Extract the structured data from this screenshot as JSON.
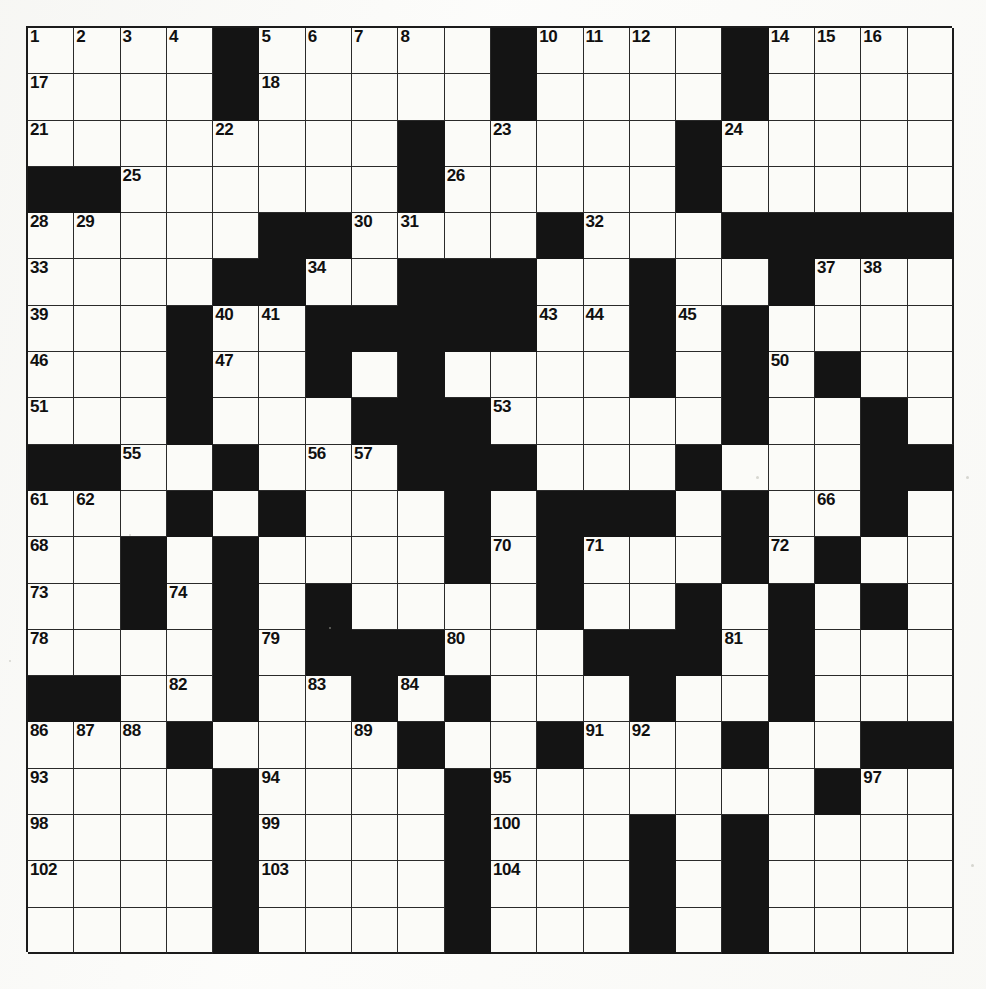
{
  "puzzle": {
    "type": "crossword",
    "title": "",
    "rows": 20,
    "cols": 20,
    "cell_size_px": 46.3,
    "colors": {
      "block": "#141414",
      "cell": "#fbfbf8",
      "grid_line": "#2a2a2a",
      "number_text": "#101010",
      "page_background": "#fdfdfc"
    },
    "max_clue_number": 105,
    "black_square_count": 116,
    "grid": [
      "....#.....#....#....",
      "....#.....#....#....",
      "........#.....#.....",
      "##......#.....#.....",
      ".....##....#...#####",
      "....##..###..#..#...",
      "...#..#####..#.#....",
      "...#..#.#....#.#.#..",
      "...#...###.....#..#.",
      "##..#...###...#...##",
      "...#.#...#.###.#..#.",
      "..#.#....#.#...#.#..",
      "..#.#.#....#..#.#.#.",
      "....#.###...###.#...",
      "##..#..#.#...#..#...",
      "...#....#..#...#..##",
      "....#....#.......#..",
      "....#....#...#.#....",
      "....#....#...#.#....",
      "....#....#...#.#...."
    ],
    "numbers": [
      {
        "n": 1,
        "row": 1,
        "col": 1
      },
      {
        "n": 2,
        "row": 1,
        "col": 2
      },
      {
        "n": 3,
        "row": 1,
        "col": 3
      },
      {
        "n": 4,
        "row": 1,
        "col": 4
      },
      {
        "n": 5,
        "row": 1,
        "col": 6
      },
      {
        "n": 6,
        "row": 1,
        "col": 7
      },
      {
        "n": 7,
        "row": 1,
        "col": 8
      },
      {
        "n": 8,
        "row": 1,
        "col": 9
      },
      {
        "n": 9,
        "row": 1,
        "col": 11
      },
      {
        "n": 10,
        "row": 1,
        "col": 12
      },
      {
        "n": 11,
        "row": 1,
        "col": 13
      },
      {
        "n": 12,
        "row": 1,
        "col": 14
      },
      {
        "n": 13,
        "row": 1,
        "col": 16
      },
      {
        "n": 14,
        "row": 1,
        "col": 17
      },
      {
        "n": 15,
        "row": 1,
        "col": 18
      },
      {
        "n": 16,
        "row": 1,
        "col": 19
      },
      {
        "n": 17,
        "row": 2,
        "col": 1
      },
      {
        "n": 18,
        "row": 2,
        "col": 6
      },
      {
        "n": 19,
        "row": 2,
        "col": 11
      },
      {
        "n": 20,
        "row": 2,
        "col": 16
      },
      {
        "n": 21,
        "row": 3,
        "col": 1
      },
      {
        "n": 22,
        "row": 3,
        "col": 5
      },
      {
        "n": 23,
        "row": 3,
        "col": 11
      },
      {
        "n": 24,
        "row": 3,
        "col": 16
      },
      {
        "n": 25,
        "row": 4,
        "col": 3
      },
      {
        "n": 26,
        "row": 4,
        "col": 10
      },
      {
        "n": 27,
        "row": 4,
        "col": 15
      },
      {
        "n": 28,
        "row": 5,
        "col": 1
      },
      {
        "n": 29,
        "row": 5,
        "col": 2
      },
      {
        "n": 30,
        "row": 5,
        "col": 8
      },
      {
        "n": 31,
        "row": 5,
        "col": 9
      },
      {
        "n": 32,
        "row": 5,
        "col": 13
      },
      {
        "n": 33,
        "row": 6,
        "col": 1
      },
      {
        "n": 34,
        "row": 6,
        "col": 7
      },
      {
        "n": 35,
        "row": 6,
        "col": 14
      },
      {
        "n": 36,
        "row": 6,
        "col": 17
      },
      {
        "n": 37,
        "row": 6,
        "col": 18
      },
      {
        "n": 38,
        "row": 6,
        "col": 19
      },
      {
        "n": 39,
        "row": 7,
        "col": 1
      },
      {
        "n": 40,
        "row": 7,
        "col": 5
      },
      {
        "n": 41,
        "row": 7,
        "col": 6
      },
      {
        "n": 42,
        "row": 7,
        "col": 11
      },
      {
        "n": 43,
        "row": 7,
        "col": 12
      },
      {
        "n": 44,
        "row": 7,
        "col": 13
      },
      {
        "n": 45,
        "row": 7,
        "col": 15
      },
      {
        "n": 46,
        "row": 8,
        "col": 1
      },
      {
        "n": 47,
        "row": 8,
        "col": 5
      },
      {
        "n": 48,
        "row": 8,
        "col": 9
      },
      {
        "n": 49,
        "row": 8,
        "col": 14
      },
      {
        "n": 50,
        "row": 8,
        "col": 17
      },
      {
        "n": 51,
        "row": 9,
        "col": 1
      },
      {
        "n": 52,
        "row": 9,
        "col": 4
      },
      {
        "n": 53,
        "row": 9,
        "col": 11
      },
      {
        "n": 54,
        "row": 9,
        "col": 16
      },
      {
        "n": 55,
        "row": 10,
        "col": 3
      },
      {
        "n": 56,
        "row": 10,
        "col": 7
      },
      {
        "n": 57,
        "row": 10,
        "col": 8
      },
      {
        "n": 58,
        "row": 10,
        "col": 9
      },
      {
        "n": 59,
        "row": 10,
        "col": 11
      },
      {
        "n": 60,
        "row": 10,
        "col": 15
      },
      {
        "n": 61,
        "row": 11,
        "col": 1
      },
      {
        "n": 62,
        "row": 11,
        "col": 2
      },
      {
        "n": 63,
        "row": 11,
        "col": 6
      },
      {
        "n": 64,
        "row": 11,
        "col": 10
      },
      {
        "n": 65,
        "row": 11,
        "col": 14
      },
      {
        "n": 66,
        "row": 11,
        "col": 18
      },
      {
        "n": 67,
        "row": 11,
        "col": 19
      },
      {
        "n": 68,
        "row": 12,
        "col": 1
      },
      {
        "n": 69,
        "row": 12,
        "col": 5
      },
      {
        "n": 70,
        "row": 12,
        "col": 11
      },
      {
        "n": 71,
        "row": 12,
        "col": 13
      },
      {
        "n": 72,
        "row": 12,
        "col": 17
      },
      {
        "n": 73,
        "row": 13,
        "col": 1
      },
      {
        "n": 74,
        "row": 13,
        "col": 4
      },
      {
        "n": 75,
        "row": 13,
        "col": 7
      },
      {
        "n": 76,
        "row": 13,
        "col": 12
      },
      {
        "n": 77,
        "row": 13,
        "col": 17
      },
      {
        "n": 78,
        "row": 14,
        "col": 1
      },
      {
        "n": 79,
        "row": 14,
        "col": 6
      },
      {
        "n": 80,
        "row": 14,
        "col": 10
      },
      {
        "n": 81,
        "row": 14,
        "col": 16
      },
      {
        "n": 82,
        "row": 15,
        "col": 4
      },
      {
        "n": 83,
        "row": 15,
        "col": 7
      },
      {
        "n": 84,
        "row": 15,
        "col": 9
      },
      {
        "n": 85,
        "row": 15,
        "col": 17
      },
      {
        "n": 86,
        "row": 16,
        "col": 1
      },
      {
        "n": 87,
        "row": 16,
        "col": 2
      },
      {
        "n": 88,
        "row": 16,
        "col": 3
      },
      {
        "n": 89,
        "row": 16,
        "col": 8
      },
      {
        "n": 90,
        "row": 16,
        "col": 12
      },
      {
        "n": 91,
        "row": 16,
        "col": 13
      },
      {
        "n": 92,
        "row": 16,
        "col": 14
      },
      {
        "n": 93,
        "row": 17,
        "col": 1
      },
      {
        "n": 94,
        "row": 17,
        "col": 6
      },
      {
        "n": 95,
        "row": 17,
        "col": 11
      },
      {
        "n": 96,
        "row": 17,
        "col": 18
      },
      {
        "n": 97,
        "row": 17,
        "col": 19
      },
      {
        "n": 98,
        "row": 18,
        "col": 1
      },
      {
        "n": 99,
        "row": 18,
        "col": 6
      },
      {
        "n": 100,
        "row": 18,
        "col": 11
      },
      {
        "n": 101,
        "row": 18,
        "col": 16
      },
      {
        "n": 102,
        "row": 19,
        "col": 1
      },
      {
        "n": 103,
        "row": 19,
        "col": 6
      },
      {
        "n": 104,
        "row": 19,
        "col": 11
      },
      {
        "n": 105,
        "row": 19,
        "col": 16
      }
    ]
  }
}
